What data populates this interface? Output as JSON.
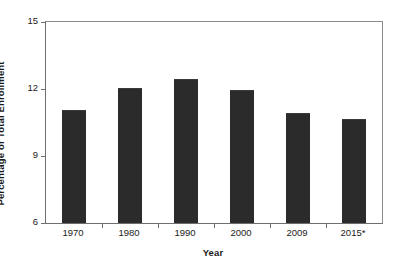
{
  "chart_data": {
    "type": "bar",
    "title": "",
    "subtitle": "",
    "xlabel": "Year",
    "ylabel": "Percentage of Total Enrollment",
    "categories": [
      "1970",
      "1980",
      "1990",
      "2000",
      "2009",
      "2015*"
    ],
    "values": [
      11.0,
      12.0,
      12.4,
      11.9,
      10.9,
      10.6
    ],
    "series": [
      {
        "name": "Percentage of Total Enrollment",
        "values": [
          11.0,
          12.0,
          12.4,
          11.9,
          10.9,
          10.6
        ]
      }
    ],
    "ylim": [
      6,
      15
    ],
    "yticks": [
      6,
      9,
      12,
      15
    ],
    "ytick_labels": [
      "6",
      "9",
      "12",
      "15"
    ],
    "xtick_labels": [
      "1970",
      "1980",
      "1990",
      "2000",
      "2009",
      "2015*"
    ],
    "grid": false,
    "legend": null,
    "legend_position": "none",
    "annotations": [],
    "bar_color": "#2b2b2b",
    "axis_color": "#6e6e6e",
    "background_color": "#ffffff"
  },
  "axes": {
    "y_title": "Percentage of Total Enrollment",
    "x_title": "Year"
  }
}
